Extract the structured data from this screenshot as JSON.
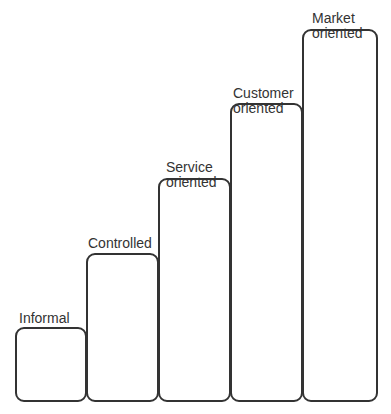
{
  "diagram": {
    "type": "staircase",
    "steps": [
      {
        "id": "informal",
        "label_lines": [
          "Informal"
        ],
        "box": {
          "left": 15,
          "top": 327,
          "width": 72,
          "height": 75
        },
        "label_pos": {
          "left": 19,
          "top": 312
        }
      },
      {
        "id": "controlled",
        "label_lines": [
          "Controlled"
        ],
        "box": {
          "left": 86,
          "top": 253,
          "width": 73,
          "height": 149
        },
        "label_pos": {
          "left": 88,
          "top": 237
        }
      },
      {
        "id": "service-oriented",
        "label_lines": [
          "Service",
          "oriented"
        ],
        "box": {
          "left": 158,
          "top": 178,
          "width": 73,
          "height": 224
        },
        "label_pos": {
          "left": 166,
          "top": 161
        }
      },
      {
        "id": "customer-oriented",
        "label_lines": [
          "Customer",
          "oriented"
        ],
        "box": {
          "left": 230,
          "top": 103,
          "width": 73,
          "height": 299
        },
        "label_pos": {
          "left": 234,
          "top": 87
        }
      },
      {
        "id": "market-oriented",
        "label_lines": [
          "Market",
          "oriented"
        ],
        "box": {
          "left": 302,
          "top": 29,
          "width": 76,
          "height": 373
        },
        "label_pos": {
          "left": 312,
          "top": 12
        }
      }
    ],
    "labels": {
      "informal": "Informal",
      "controlled": "Controlled",
      "service_1": "Service",
      "service_2": "oriented",
      "customer_1": "Customer",
      "customer_2": "oriented",
      "market_1": "Market",
      "market_2": "oriented"
    },
    "footer_text": "",
    "colors": {
      "stroke": "#333333",
      "text": "#333333",
      "background": "#ffffff"
    }
  }
}
